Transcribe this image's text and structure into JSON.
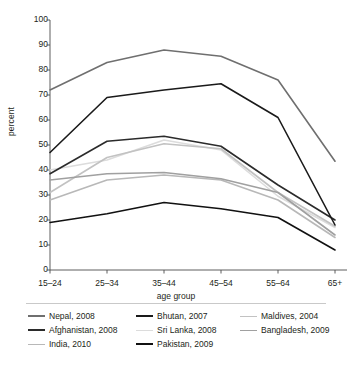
{
  "chart_data": {
    "type": "line",
    "title": "",
    "xlabel": "age group",
    "ylabel": "percent",
    "categories": [
      "15–24",
      "25–34",
      "35–44",
      "45–54",
      "55–64",
      "65+"
    ],
    "ylim": [
      0,
      100
    ],
    "yticks": [
      0,
      10,
      20,
      30,
      40,
      50,
      60,
      70,
      80,
      90,
      100
    ],
    "grid": false,
    "legend_position": "bottom",
    "series": [
      {
        "name": "Nepal, 2008",
        "color": "#6f6f6f",
        "width": 1.6,
        "values": [
          72,
          83,
          88,
          85.5,
          76,
          43.5
        ]
      },
      {
        "name": "Bhutan, 2007",
        "color": "#1a1a1a",
        "width": 1.6,
        "values": [
          47,
          69,
          72,
          74.5,
          61,
          18
        ]
      },
      {
        "name": "Maldives, 2004",
        "color": "#c2c2c2",
        "width": 1.6,
        "values": [
          31,
          45,
          50.5,
          48.5,
          31,
          17.5
        ]
      },
      {
        "name": "Afghanistan, 2008",
        "color": "#2b2b2b",
        "width": 1.6,
        "values": [
          38.5,
          51.5,
          53.5,
          49.5,
          34,
          20
        ]
      },
      {
        "name": "Sri Lanka, 2008",
        "color": "#dcdcdc",
        "width": 1.6,
        "values": [
          40,
          44,
          52,
          48,
          29.5,
          17
        ]
      },
      {
        "name": "Bangladesh, 2009",
        "color": "#a0a0a0",
        "width": 1.6,
        "values": [
          36,
          38.5,
          39,
          36.5,
          31,
          14
        ]
      },
      {
        "name": "India, 2010",
        "color": "#b8b8b8",
        "width": 1.6,
        "values": [
          28,
          36,
          38,
          36,
          28,
          13
        ]
      },
      {
        "name": "Pakistan, 2009",
        "color": "#111111",
        "width": 1.6,
        "values": [
          19,
          22.5,
          27,
          24.5,
          21,
          8
        ]
      }
    ]
  },
  "axes": {
    "ylabel": "percent",
    "xlabel": "age group",
    "ytick_labels": [
      "100",
      "90",
      "80",
      "70",
      "60",
      "50",
      "40",
      "30",
      "20",
      "10",
      "0"
    ],
    "xtick_labels": [
      "15–24",
      "25–34",
      "35–44",
      "45–54",
      "55–64",
      "65+"
    ]
  },
  "legend": {
    "items": [
      {
        "label": "Nepal, 2008",
        "color": "#6f6f6f"
      },
      {
        "label": "Bhutan, 2007",
        "color": "#1a1a1a"
      },
      {
        "label": "Maldives, 2004",
        "color": "#c2c2c2"
      },
      {
        "label": "Afghanistan, 2008",
        "color": "#2b2b2b"
      },
      {
        "label": "Sri Lanka, 2008",
        "color": "#dcdcdc"
      },
      {
        "label": "Bangladesh, 2009",
        "color": "#a0a0a0"
      },
      {
        "label": "India, 2010",
        "color": "#b8b8b8"
      },
      {
        "label": "Pakistan, 2009",
        "color": "#111111"
      }
    ]
  }
}
